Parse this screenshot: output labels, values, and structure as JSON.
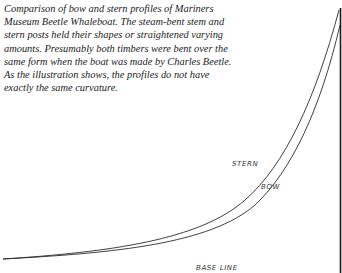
{
  "caption": "Comparison of bow and stern profiles of Mariners Museum Beetle Whaleboat. The steam-bent stem and stern posts held their shapes or straightened varying amounts. Presumably both timbers were bent over the same form when the boat was made by Charles Beetle. As the illustration shows, the profiles do not have exactly the same curvature.",
  "labels": {
    "stern": "STERN",
    "bow": "BOW",
    "base_line": "BASE LINE"
  },
  "colors": {
    "line": "#2a2a2a",
    "text": "#222222"
  }
}
